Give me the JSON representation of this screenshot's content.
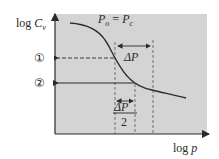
{
  "diagram": {
    "y_axis_label": {
      "prefix": "log ",
      "var": "C",
      "sub": "v"
    },
    "x_axis_label": {
      "prefix": "log ",
      "var": "p"
    },
    "curve_label": {
      "lhs": "P",
      "lhs_sub": "o",
      "eq": " = ",
      "rhs": "P",
      "rhs_sub": "c"
    },
    "markers": [
      {
        "id": 1,
        "symbol": "①",
        "line_style": "dashed"
      },
      {
        "id": 2,
        "symbol": "②",
        "line_style": "solid"
      }
    ],
    "delta_labels": {
      "full": "ΔP",
      "half_numerator": "ΔP",
      "half_denominator": "2"
    },
    "colors": {
      "plot_bg": "#d4d4d4",
      "line": "#2a2a2a",
      "background": "#ffffff"
    }
  }
}
